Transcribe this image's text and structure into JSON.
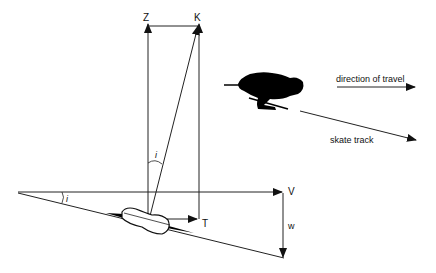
{
  "diagram": {
    "labels": {
      "z": "Z",
      "k": "K",
      "v": "V",
      "t": "T",
      "w": "w",
      "angle_top": "i",
      "angle_left": "i"
    },
    "annotations": {
      "direction": "direction of travel",
      "track": "skate track"
    },
    "colors": {
      "line": "#222222",
      "fill": "#000000",
      "background": "#ffffff"
    }
  }
}
